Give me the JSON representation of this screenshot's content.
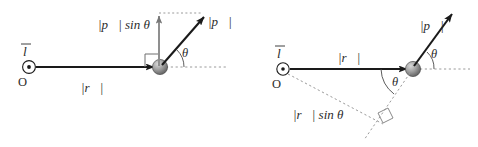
{
  "figure": {
    "background_color": "#ffffff",
    "stroke_color": "#1a1a1a",
    "guide_color": "#9a9a9a",
    "text_color": "#2b2b2b",
    "sphere_color": "#8c8c8c"
  },
  "left_diagram": {
    "name": "momentum-perpendicular-component",
    "origin_label": "O",
    "axis_label": "l",
    "r_label_bars": "|",
    "r_symbol": "r",
    "r_label": "|r⃗|",
    "p_label": "|p⃗|",
    "p_sin_label": "|p⃗| sin θ",
    "angle_label": "θ",
    "p_sin_prefix_bar": "|",
    "p_sin_suffix": "sin",
    "right_angle_marker": "right-angle"
  },
  "right_diagram": {
    "name": "radius-perpendicular-component",
    "origin_label": "O",
    "axis_label": "l",
    "r_label": "|r⃗|",
    "p_label": "|p⃗|",
    "r_sin_label": "|r⃗| sin θ",
    "angle_label_upper": "θ",
    "angle_label_lower": "θ",
    "right_angle_marker": "right-angle"
  },
  "glyphs": {
    "vector_arrow": "⃗",
    "theta": "θ",
    "bar": "|",
    "sin": "sin",
    "dot_out_of_page": "⊙"
  }
}
